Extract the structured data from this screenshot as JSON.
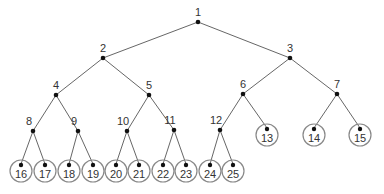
{
  "diagram": {
    "type": "binary-tree",
    "nodes": [
      {
        "id": 1,
        "label": "1",
        "x": 198,
        "y": 22,
        "leaf": false
      },
      {
        "id": 2,
        "label": "2",
        "x": 103,
        "y": 58,
        "leaf": false
      },
      {
        "id": 3,
        "label": "3",
        "x": 290,
        "y": 58,
        "leaf": false
      },
      {
        "id": 4,
        "label": "4",
        "x": 56,
        "y": 95,
        "leaf": false
      },
      {
        "id": 5,
        "label": "5",
        "x": 149,
        "y": 95,
        "leaf": false
      },
      {
        "id": 6,
        "label": "6",
        "x": 243,
        "y": 94,
        "leaf": false
      },
      {
        "id": 7,
        "label": "7",
        "x": 337,
        "y": 94,
        "leaf": false
      },
      {
        "id": 8,
        "label": "8",
        "x": 33,
        "y": 131,
        "leaf": false
      },
      {
        "id": 9,
        "label": "9",
        "x": 78,
        "y": 131,
        "leaf": false
      },
      {
        "id": 10,
        "label": "10",
        "x": 127,
        "y": 131,
        "leaf": false
      },
      {
        "id": 11,
        "label": "11",
        "x": 174,
        "y": 130,
        "leaf": false
      },
      {
        "id": 12,
        "label": "12",
        "x": 220,
        "y": 130,
        "leaf": false
      },
      {
        "id": 13,
        "label": "13",
        "x": 267,
        "y": 134,
        "leaf": true
      },
      {
        "id": 14,
        "label": "14",
        "x": 314,
        "y": 134,
        "leaf": true
      },
      {
        "id": 15,
        "label": "15",
        "x": 360,
        "y": 134,
        "leaf": true
      },
      {
        "id": 16,
        "label": "16",
        "x": 21,
        "y": 170,
        "leaf": true
      },
      {
        "id": 17,
        "label": "17",
        "x": 45,
        "y": 170,
        "leaf": true
      },
      {
        "id": 18,
        "label": "18",
        "x": 69,
        "y": 170,
        "leaf": true
      },
      {
        "id": 19,
        "label": "19",
        "x": 93,
        "y": 170,
        "leaf": true
      },
      {
        "id": 20,
        "label": "20",
        "x": 116,
        "y": 170,
        "leaf": true
      },
      {
        "id": 21,
        "label": "21",
        "x": 139,
        "y": 170,
        "leaf": true
      },
      {
        "id": 22,
        "label": "22",
        "x": 163,
        "y": 170,
        "leaf": true
      },
      {
        "id": 23,
        "label": "23",
        "x": 186,
        "y": 170,
        "leaf": true
      },
      {
        "id": 24,
        "label": "24",
        "x": 210,
        "y": 170,
        "leaf": true
      },
      {
        "id": 25,
        "label": "25",
        "x": 233,
        "y": 170,
        "leaf": true
      }
    ],
    "edges": [
      [
        1,
        2
      ],
      [
        1,
        3
      ],
      [
        2,
        4
      ],
      [
        2,
        5
      ],
      [
        3,
        6
      ],
      [
        3,
        7
      ],
      [
        4,
        8
      ],
      [
        4,
        9
      ],
      [
        5,
        10
      ],
      [
        5,
        11
      ],
      [
        6,
        12
      ],
      [
        6,
        13
      ],
      [
        7,
        14
      ],
      [
        7,
        15
      ],
      [
        8,
        16
      ],
      [
        8,
        17
      ],
      [
        9,
        18
      ],
      [
        9,
        19
      ],
      [
        10,
        20
      ],
      [
        10,
        21
      ],
      [
        11,
        22
      ],
      [
        11,
        23
      ],
      [
        12,
        24
      ],
      [
        12,
        25
      ]
    ],
    "colors": {
      "edge": "#555555",
      "dot": "#111111",
      "leaf_ring": "#888888",
      "label": "#333333"
    }
  }
}
